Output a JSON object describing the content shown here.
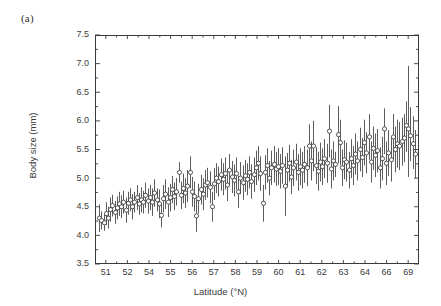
{
  "figure": {
    "panel_label": "(a)",
    "background_color": "#ffffff",
    "axis_color": "#3a3a3a",
    "errorbar_color": "#404040",
    "marker_face_color": "#ffffff"
  },
  "chart_data": {
    "type": "scatter",
    "title": "",
    "subtitle": "",
    "xlabel": "Latitude (°N)",
    "ylabel": "Body size (mm)",
    "grid": false,
    "legend": null,
    "error_bars": "vertical",
    "marker": "open-circle",
    "ylim": [
      3.5,
      7.5
    ],
    "yticks": [
      3.5,
      4.0,
      4.5,
      5.0,
      5.5,
      6.0,
      6.5,
      7.0,
      7.5
    ],
    "ytick_labels": [
      "3.5",
      "4.0",
      "4.5",
      "5.0",
      "5.5",
      "6.0",
      "6.5",
      "7.0",
      "7.5"
    ],
    "xtick_labels": [
      "51",
      "52",
      "54",
      "55",
      "56",
      "57",
      "58",
      "59",
      "60",
      "61",
      "62",
      "63",
      "64",
      "66",
      "69"
    ],
    "x_axis_kind": "categorical-nonuniform",
    "n_points": 145,
    "plot_box_px": {
      "left": 95,
      "top": 35,
      "right": 419,
      "bottom": 264
    },
    "series": [
      {
        "name": "Mean body size with 95% CI",
        "points": [
          {
            "i": 0,
            "mean": 4.3,
            "lo": 4.06,
            "hi": 4.54
          },
          {
            "i": 1,
            "mean": 4.26,
            "lo": 4.1,
            "hi": 4.42
          },
          {
            "i": 2,
            "mean": 4.22,
            "lo": 4.08,
            "hi": 4.38
          },
          {
            "i": 3,
            "mean": 4.38,
            "lo": 4.18,
            "hi": 4.58
          },
          {
            "i": 4,
            "mean": 4.3,
            "lo": 4.12,
            "hi": 4.5
          },
          {
            "i": 5,
            "mean": 4.45,
            "lo": 4.24,
            "hi": 4.66
          },
          {
            "i": 6,
            "mean": 4.52,
            "lo": 4.33,
            "hi": 4.71
          },
          {
            "i": 7,
            "mean": 4.4,
            "lo": 4.2,
            "hi": 4.6
          },
          {
            "i": 8,
            "mean": 4.48,
            "lo": 4.28,
            "hi": 4.68
          },
          {
            "i": 9,
            "mean": 4.55,
            "lo": 4.34,
            "hi": 4.76
          },
          {
            "i": 10,
            "mean": 4.5,
            "lo": 4.3,
            "hi": 4.7
          },
          {
            "i": 11,
            "mean": 4.58,
            "lo": 4.38,
            "hi": 4.78
          },
          {
            "i": 12,
            "mean": 4.44,
            "lo": 4.22,
            "hi": 4.66
          },
          {
            "i": 13,
            "mean": 4.56,
            "lo": 4.36,
            "hi": 4.76
          },
          {
            "i": 14,
            "mean": 4.62,
            "lo": 4.42,
            "hi": 4.82
          },
          {
            "i": 15,
            "mean": 4.5,
            "lo": 4.28,
            "hi": 4.72
          },
          {
            "i": 16,
            "mean": 4.58,
            "lo": 4.4,
            "hi": 4.76
          },
          {
            "i": 17,
            "mean": 4.66,
            "lo": 4.44,
            "hi": 4.88
          },
          {
            "i": 18,
            "mean": 4.55,
            "lo": 4.36,
            "hi": 4.74
          },
          {
            "i": 19,
            "mean": 4.62,
            "lo": 4.4,
            "hi": 4.84
          },
          {
            "i": 20,
            "mean": 4.58,
            "lo": 4.38,
            "hi": 4.78
          },
          {
            "i": 21,
            "mean": 4.7,
            "lo": 4.48,
            "hi": 4.92
          },
          {
            "i": 22,
            "mean": 4.6,
            "lo": 4.38,
            "hi": 4.82
          },
          {
            "i": 23,
            "mean": 4.66,
            "lo": 4.44,
            "hi": 4.88
          },
          {
            "i": 24,
            "mean": 4.58,
            "lo": 4.34,
            "hi": 4.82
          },
          {
            "i": 25,
            "mean": 4.74,
            "lo": 4.5,
            "hi": 4.98
          },
          {
            "i": 26,
            "mean": 4.62,
            "lo": 4.42,
            "hi": 4.82
          },
          {
            "i": 27,
            "mean": 4.55,
            "lo": 4.3,
            "hi": 4.8
          },
          {
            "i": 28,
            "mean": 4.35,
            "lo": 4.14,
            "hi": 4.56
          },
          {
            "i": 29,
            "mean": 4.64,
            "lo": 4.4,
            "hi": 4.88
          },
          {
            "i": 30,
            "mean": 4.72,
            "lo": 4.46,
            "hi": 4.98
          },
          {
            "i": 31,
            "mean": 4.58,
            "lo": 4.32,
            "hi": 4.84
          },
          {
            "i": 32,
            "mean": 4.66,
            "lo": 4.42,
            "hi": 4.9
          },
          {
            "i": 33,
            "mean": 4.8,
            "lo": 4.56,
            "hi": 5.04
          },
          {
            "i": 34,
            "mean": 4.68,
            "lo": 4.44,
            "hi": 4.92
          },
          {
            "i": 35,
            "mean": 4.76,
            "lo": 4.52,
            "hi": 5.0
          },
          {
            "i": 36,
            "mean": 5.1,
            "lo": 4.92,
            "hi": 5.28
          },
          {
            "i": 37,
            "mean": 4.7,
            "lo": 4.46,
            "hi": 4.94
          },
          {
            "i": 38,
            "mean": 4.82,
            "lo": 4.56,
            "hi": 5.08
          },
          {
            "i": 39,
            "mean": 4.74,
            "lo": 4.48,
            "hi": 5.0
          },
          {
            "i": 40,
            "mean": 4.86,
            "lo": 4.58,
            "hi": 5.14
          },
          {
            "i": 41,
            "mean": 5.1,
            "lo": 4.82,
            "hi": 5.38
          },
          {
            "i": 42,
            "mean": 4.76,
            "lo": 4.5,
            "hi": 5.02
          },
          {
            "i": 43,
            "mean": 4.68,
            "lo": 4.42,
            "hi": 4.94
          },
          {
            "i": 44,
            "mean": 4.34,
            "lo": 4.06,
            "hi": 4.62
          },
          {
            "i": 45,
            "mean": 4.64,
            "lo": 4.38,
            "hi": 4.9
          },
          {
            "i": 46,
            "mean": 4.8,
            "lo": 4.54,
            "hi": 5.06
          },
          {
            "i": 47,
            "mean": 4.72,
            "lo": 4.44,
            "hi": 5.0
          },
          {
            "i": 48,
            "mean": 4.88,
            "lo": 4.62,
            "hi": 5.14
          },
          {
            "i": 49,
            "mean": 4.92,
            "lo": 4.66,
            "hi": 5.18
          },
          {
            "i": 50,
            "mean": 4.84,
            "lo": 4.56,
            "hi": 5.12
          },
          {
            "i": 51,
            "mean": 4.5,
            "lo": 4.24,
            "hi": 4.76
          },
          {
            "i": 52,
            "mean": 4.9,
            "lo": 4.62,
            "hi": 5.18
          },
          {
            "i": 53,
            "mean": 5.0,
            "lo": 4.74,
            "hi": 5.26
          },
          {
            "i": 54,
            "mean": 4.94,
            "lo": 4.68,
            "hi": 5.2
          },
          {
            "i": 55,
            "mean": 5.06,
            "lo": 4.78,
            "hi": 5.34
          },
          {
            "i": 56,
            "mean": 4.98,
            "lo": 4.7,
            "hi": 5.26
          },
          {
            "i": 57,
            "mean": 5.08,
            "lo": 4.8,
            "hi": 5.36
          },
          {
            "i": 58,
            "mean": 4.88,
            "lo": 4.6,
            "hi": 5.16
          },
          {
            "i": 59,
            "mean": 5.14,
            "lo": 4.86,
            "hi": 5.42
          },
          {
            "i": 60,
            "mean": 5.02,
            "lo": 4.74,
            "hi": 5.3
          },
          {
            "i": 61,
            "mean": 4.96,
            "lo": 4.68,
            "hi": 5.24
          },
          {
            "i": 62,
            "mean": 5.08,
            "lo": 4.8,
            "hi": 5.36
          },
          {
            "i": 63,
            "mean": 4.76,
            "lo": 4.48,
            "hi": 5.04
          },
          {
            "i": 64,
            "mean": 5.0,
            "lo": 4.72,
            "hi": 5.28
          },
          {
            "i": 65,
            "mean": 4.92,
            "lo": 4.62,
            "hi": 5.22
          },
          {
            "i": 66,
            "mean": 5.04,
            "lo": 4.76,
            "hi": 5.32
          },
          {
            "i": 67,
            "mean": 4.98,
            "lo": 4.7,
            "hi": 5.26
          },
          {
            "i": 68,
            "mean": 5.1,
            "lo": 4.82,
            "hi": 5.38
          },
          {
            "i": 69,
            "mean": 4.94,
            "lo": 4.64,
            "hi": 5.24
          },
          {
            "i": 70,
            "mean": 5.06,
            "lo": 4.76,
            "hi": 5.36
          },
          {
            "i": 71,
            "mean": 5.18,
            "lo": 4.88,
            "hi": 5.48
          },
          {
            "i": 72,
            "mean": 5.26,
            "lo": 4.96,
            "hi": 5.56
          },
          {
            "i": 73,
            "mean": 5.08,
            "lo": 4.78,
            "hi": 5.38
          },
          {
            "i": 74,
            "mean": 4.56,
            "lo": 4.24,
            "hi": 4.88
          },
          {
            "i": 75,
            "mean": 5.1,
            "lo": 4.8,
            "hi": 5.4
          },
          {
            "i": 76,
            "mean": 5.22,
            "lo": 4.92,
            "hi": 5.52
          },
          {
            "i": 77,
            "mean": 5.0,
            "lo": 4.7,
            "hi": 5.3
          },
          {
            "i": 78,
            "mean": 5.18,
            "lo": 4.88,
            "hi": 5.48
          },
          {
            "i": 79,
            "mean": 5.24,
            "lo": 4.92,
            "hi": 5.56
          },
          {
            "i": 80,
            "mean": 5.16,
            "lo": 4.86,
            "hi": 5.46
          },
          {
            "i": 81,
            "mean": 5.2,
            "lo": 4.88,
            "hi": 5.52
          },
          {
            "i": 82,
            "mean": 5.12,
            "lo": 4.82,
            "hi": 5.42
          },
          {
            "i": 83,
            "mean": 5.22,
            "lo": 4.9,
            "hi": 5.54
          },
          {
            "i": 84,
            "mean": 4.86,
            "lo": 4.34,
            "hi": 5.38
          },
          {
            "i": 85,
            "mean": 5.14,
            "lo": 4.84,
            "hi": 5.44
          },
          {
            "i": 86,
            "mean": 5.26,
            "lo": 4.94,
            "hi": 5.58
          },
          {
            "i": 87,
            "mean": 5.02,
            "lo": 4.72,
            "hi": 5.32
          },
          {
            "i": 88,
            "mean": 5.18,
            "lo": 4.86,
            "hi": 5.5
          },
          {
            "i": 89,
            "mean": 5.28,
            "lo": 4.96,
            "hi": 5.6
          },
          {
            "i": 90,
            "mean": 5.1,
            "lo": 4.78,
            "hi": 5.42
          },
          {
            "i": 91,
            "mean": 5.2,
            "lo": 4.88,
            "hi": 5.52
          },
          {
            "i": 92,
            "mean": 5.14,
            "lo": 4.82,
            "hi": 5.46
          },
          {
            "i": 93,
            "mean": 5.24,
            "lo": 4.92,
            "hi": 5.56
          },
          {
            "i": 94,
            "mean": 5.18,
            "lo": 4.86,
            "hi": 5.5
          },
          {
            "i": 95,
            "mean": 5.56,
            "lo": 5.18,
            "hi": 5.94
          },
          {
            "i": 96,
            "mean": 5.3,
            "lo": 4.96,
            "hi": 5.64
          },
          {
            "i": 97,
            "mean": 5.56,
            "lo": 5.12,
            "hi": 6.0
          },
          {
            "i": 98,
            "mean": 5.22,
            "lo": 4.9,
            "hi": 5.54
          },
          {
            "i": 99,
            "mean": 5.12,
            "lo": 4.78,
            "hi": 5.46
          },
          {
            "i": 100,
            "mean": 5.28,
            "lo": 4.94,
            "hi": 5.62
          },
          {
            "i": 101,
            "mean": 5.2,
            "lo": 4.88,
            "hi": 5.52
          },
          {
            "i": 102,
            "mean": 5.34,
            "lo": 5.0,
            "hi": 5.68
          },
          {
            "i": 103,
            "mean": 5.26,
            "lo": 4.92,
            "hi": 5.6
          },
          {
            "i": 104,
            "mean": 5.82,
            "lo": 5.36,
            "hi": 6.28
          },
          {
            "i": 105,
            "mean": 5.16,
            "lo": 4.82,
            "hi": 5.5
          },
          {
            "i": 106,
            "mean": 5.3,
            "lo": 4.96,
            "hi": 5.64
          },
          {
            "i": 107,
            "mean": 5.24,
            "lo": 5.02,
            "hi": 5.46
          },
          {
            "i": 108,
            "mean": 5.76,
            "lo": 5.26,
            "hi": 6.26
          },
          {
            "i": 109,
            "mean": 5.62,
            "lo": 5.22,
            "hi": 6.02
          },
          {
            "i": 110,
            "mean": 5.18,
            "lo": 4.86,
            "hi": 5.5
          },
          {
            "i": 111,
            "mean": 5.32,
            "lo": 4.98,
            "hi": 5.66
          },
          {
            "i": 112,
            "mean": 5.28,
            "lo": 4.94,
            "hi": 5.62
          },
          {
            "i": 113,
            "mean": 5.14,
            "lo": 4.82,
            "hi": 5.46
          },
          {
            "i": 114,
            "mean": 5.34,
            "lo": 5.0,
            "hi": 5.68
          },
          {
            "i": 115,
            "mean": 5.22,
            "lo": 4.88,
            "hi": 5.56
          },
          {
            "i": 116,
            "mean": 5.42,
            "lo": 5.06,
            "hi": 5.78
          },
          {
            "i": 117,
            "mean": 5.3,
            "lo": 4.96,
            "hi": 5.64
          },
          {
            "i": 118,
            "mean": 5.5,
            "lo": 5.12,
            "hi": 5.88
          },
          {
            "i": 119,
            "mean": 5.36,
            "lo": 5.02,
            "hi": 5.7
          },
          {
            "i": 120,
            "mean": 5.62,
            "lo": 5.22,
            "hi": 6.02
          },
          {
            "i": 121,
            "mean": 5.44,
            "lo": 5.08,
            "hi": 5.8
          },
          {
            "i": 122,
            "mean": 5.72,
            "lo": 5.32,
            "hi": 6.12
          },
          {
            "i": 123,
            "mean": 5.28,
            "lo": 4.92,
            "hi": 5.64
          },
          {
            "i": 124,
            "mean": 5.52,
            "lo": 5.14,
            "hi": 5.9
          },
          {
            "i": 125,
            "mean": 5.4,
            "lo": 5.02,
            "hi": 5.78
          },
          {
            "i": 126,
            "mean": 5.48,
            "lo": 5.1,
            "hi": 5.86
          },
          {
            "i": 127,
            "mean": 5.18,
            "lo": 4.82,
            "hi": 5.54
          },
          {
            "i": 128,
            "mean": 5.34,
            "lo": 4.96,
            "hi": 5.72
          },
          {
            "i": 129,
            "mean": 5.86,
            "lo": 5.42,
            "hi": 6.22
          },
          {
            "i": 130,
            "mean": 5.26,
            "lo": 4.88,
            "hi": 5.64
          },
          {
            "i": 131,
            "mean": 5.44,
            "lo": 5.04,
            "hi": 5.84
          },
          {
            "i": 132,
            "mean": 5.32,
            "lo": 4.94,
            "hi": 5.7
          },
          {
            "i": 133,
            "mean": 5.72,
            "lo": 5.32,
            "hi": 6.12
          },
          {
            "i": 134,
            "mean": 5.5,
            "lo": 5.1,
            "hi": 5.9
          },
          {
            "i": 135,
            "mean": 5.6,
            "lo": 5.18,
            "hi": 6.02
          },
          {
            "i": 136,
            "mean": 5.56,
            "lo": 5.14,
            "hi": 5.98
          },
          {
            "i": 137,
            "mean": 5.64,
            "lo": 5.22,
            "hi": 6.06
          },
          {
            "i": 138,
            "mean": 5.7,
            "lo": 5.28,
            "hi": 6.12
          },
          {
            "i": 139,
            "mean": 5.92,
            "lo": 5.46,
            "hi": 6.34
          },
          {
            "i": 140,
            "mean": 5.86,
            "lo": 5.02,
            "hi": 6.96
          },
          {
            "i": 141,
            "mean": 5.74,
            "lo": 5.3,
            "hi": 6.24
          },
          {
            "i": 142,
            "mean": 5.6,
            "lo": 5.16,
            "hi": 6.08
          },
          {
            "i": 143,
            "mean": 5.42,
            "lo": 5.0,
            "hi": 5.84
          }
        ]
      }
    ]
  }
}
